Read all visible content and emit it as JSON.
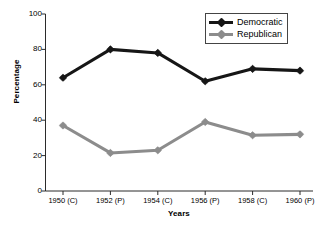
{
  "chart_data": {
    "type": "line",
    "title": "",
    "xlabel": "Years",
    "ylabel": "Percentage",
    "categories": [
      "1950 (C)",
      "1952 (P)",
      "1954 (C)",
      "1956 (P)",
      "1958 (C)",
      "1960 (P)"
    ],
    "series": [
      {
        "name": "Democratic",
        "color": "#161616",
        "values": [
          64,
          80,
          78,
          62,
          69,
          68
        ]
      },
      {
        "name": "Republican",
        "color": "#8c8c8c",
        "values": [
          37,
          21.5,
          23,
          39,
          31.5,
          32
        ]
      }
    ],
    "ylim": [
      0,
      100
    ],
    "yticks": [
      0,
      20,
      40,
      60,
      80,
      100
    ],
    "ytick_labels": [
      "0",
      "20",
      "40",
      "60",
      "80",
      "100"
    ],
    "grid": false,
    "legend_position": "top-right"
  },
  "legend": {
    "entries": [
      {
        "label": "Democratic"
      },
      {
        "label": "Republican"
      }
    ]
  },
  "axes": {
    "y_title": "Percentage",
    "x_title": "Years"
  }
}
